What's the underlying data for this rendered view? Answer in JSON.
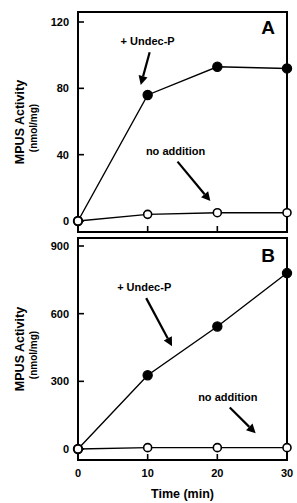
{
  "figure": {
    "width": 297,
    "height": 503,
    "background": "#ffffff",
    "ink_color": "#000000",
    "x_axis_title": "Time (min)",
    "y_axis_title": "MPUS Activity",
    "y_axis_subtitle": "(nmol/mg)"
  },
  "chart_data": [
    {
      "type": "line",
      "panel": "A",
      "title": "",
      "xlabel": "Time (min)",
      "ylabel": "MPUS Activity (nmol/mg)",
      "x": [
        0,
        10,
        20,
        30
      ],
      "xticks": [
        0,
        10,
        20,
        30
      ],
      "xticklabels": [
        "0",
        "10",
        "20",
        "30"
      ],
      "xlim": [
        0,
        30
      ],
      "yticks": [
        0,
        40,
        80,
        120
      ],
      "yticklabels": [
        "0",
        "40",
        "80",
        "120"
      ],
      "ylim": [
        0,
        120
      ],
      "grid": false,
      "legend": "annotations",
      "series": [
        {
          "name": "+ Undec-P",
          "marker": "filled-circle",
          "values": [
            0,
            76,
            93,
            92
          ]
        },
        {
          "name": "no addition",
          "marker": "open-circle",
          "values": [
            0,
            4,
            5,
            5
          ]
        }
      ],
      "annotations": [
        {
          "text": "+ Undec-P",
          "x_text": 10.0,
          "y_text": 106,
          "x_tip": 9.0,
          "y_tip": 82
        },
        {
          "text": "no addition",
          "x_text": 14.0,
          "y_text": 40,
          "x_tip": 19.0,
          "y_tip": 12
        }
      ]
    },
    {
      "type": "line",
      "panel": "B",
      "title": "",
      "xlabel": "Time (min)",
      "ylabel": "MPUS Activity (nmol/mg)",
      "x": [
        0,
        10,
        20,
        30
      ],
      "xticks": [
        0,
        10,
        20,
        30
      ],
      "xticklabels": [
        "0",
        "10",
        "20",
        "30"
      ],
      "xlim": [
        0,
        30
      ],
      "yticks": [
        0,
        300,
        600,
        900
      ],
      "yticklabels": [
        "0",
        "300",
        "600",
        "900"
      ],
      "ylim": [
        0,
        900
      ],
      "grid": false,
      "legend": "annotations",
      "series": [
        {
          "name": "+ Undec-P",
          "marker": "filled-circle",
          "values": [
            0,
            327,
            543,
            780
          ]
        },
        {
          "name": "no addition",
          "marker": "open-circle",
          "values": [
            0,
            6,
            6,
            6
          ]
        }
      ],
      "annotations": [
        {
          "text": "+ Undec-P",
          "x_text": 9.5,
          "y_text": 700,
          "x_tip": 13.5,
          "y_tip": 455
        },
        {
          "text": "no addition",
          "x_text": 21.5,
          "y_text": 215,
          "x_tip": 25.5,
          "y_tip": 70
        }
      ]
    }
  ]
}
